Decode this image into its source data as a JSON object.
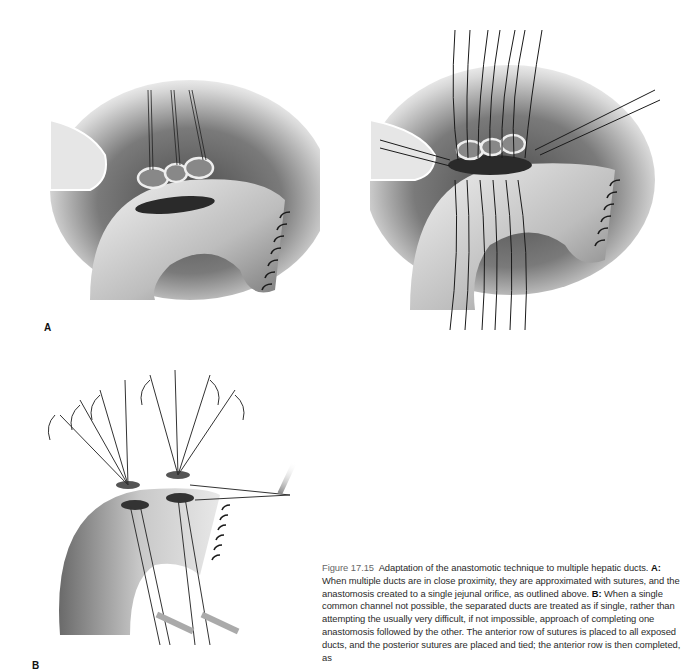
{
  "figure": {
    "number": "Figure 17.15",
    "panels": [
      {
        "id": "A",
        "label": "A",
        "description": "Multiple approximated hepatic ducts held by stay sutures above jejunal loop with single enterotomy orifice"
      },
      {
        "id": "A2",
        "label": "",
        "description": "Sutures placed through approximated ducts and single jejunal orifice"
      },
      {
        "id": "B",
        "label": "B",
        "description": "Separated ducts each anastomosed individually with sutures held by clamps"
      }
    ],
    "caption": {
      "title": "Adaptation of the anastomotic technique to multiple hepatic ducts.",
      "a_label": "A:",
      "a_text": "When multiple ducts are in close proximity, they are approximated with sutures, and the anastomosis created to a single jejunal orifice, as outlined above.",
      "b_label": "B:",
      "b_text": "When a single common channel not possible, the separated ducts are treated as if single, rather than attempting the usually very difficult, if not impossible, approach of completing one anastomosis followed by the other. The anterior row of sutures is placed to all exposed ducts, and the posterior sutures are placed and tied; the anterior row is then completed, as"
    }
  }
}
